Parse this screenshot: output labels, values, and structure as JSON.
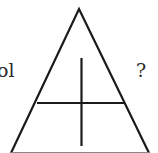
{
  "diagram": {
    "left_label": "ol",
    "right_label": "?",
    "stroke_color": "#1a1a1a",
    "shape": {
      "type": "triangle",
      "apex": [
        79,
        9
      ],
      "bottom_left": [
        11,
        153
      ],
      "bottom_right": [
        149,
        153
      ],
      "horizontal_line": {
        "y": 103,
        "x1": 37,
        "x2": 125
      },
      "vertical_line": {
        "x": 81.5,
        "y1": 58,
        "y2": 146
      }
    }
  }
}
